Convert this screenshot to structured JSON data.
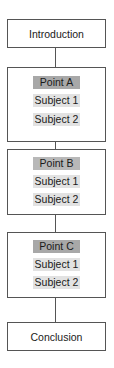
{
  "diagram": {
    "type": "vertical-flow",
    "colors": {
      "border": "#555555",
      "point_fill": "#a8a8a8",
      "subject_fill": "#e2e2e2",
      "background": "#ffffff"
    },
    "intro": {
      "label": "Introduction"
    },
    "sections": [
      {
        "point": "Point A",
        "subjects": [
          "Subject 1",
          "Subject 2"
        ]
      },
      {
        "point": "Point B",
        "subjects": [
          "Subject 1",
          "Subject 2"
        ]
      },
      {
        "point": "Point C",
        "subjects": [
          "Subject 1",
          "Subject 2"
        ]
      }
    ],
    "conclusion": {
      "label": "Conclusion"
    }
  }
}
